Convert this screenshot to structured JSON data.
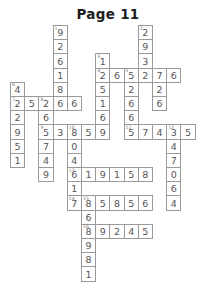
{
  "page": {
    "title": "Page 11"
  },
  "puzzle": {
    "type": "number-crossword",
    "columns": 14,
    "rows": 15,
    "cell_size": 14.2,
    "origin_x": 10,
    "origin_y": 25,
    "border_color": "#9a9a9a",
    "digit_color": "#555555",
    "clue_number_color": "#777777",
    "cells": [
      {
        "c": 3,
        "r": 0,
        "d": "9",
        "n": "1"
      },
      {
        "c": 3,
        "r": 1,
        "d": "2"
      },
      {
        "c": 3,
        "r": 2,
        "d": "6"
      },
      {
        "c": 3,
        "r": 3,
        "d": "1"
      },
      {
        "c": 3,
        "r": 4,
        "d": "8"
      },
      {
        "c": 3,
        "r": 5,
        "d": "6"
      },
      {
        "c": 9,
        "r": 0,
        "d": "2",
        "n": "2"
      },
      {
        "c": 9,
        "r": 1,
        "d": "9"
      },
      {
        "c": 9,
        "r": 2,
        "d": "3"
      },
      {
        "c": 6,
        "r": 2,
        "d": "1",
        "n": "3"
      },
      {
        "c": 6,
        "r": 3,
        "d": "2",
        "n": "4"
      },
      {
        "c": 7,
        "r": 3,
        "d": "6"
      },
      {
        "c": 8,
        "r": 3,
        "d": "5",
        "n": "5"
      },
      {
        "c": 9,
        "r": 3,
        "d": "2"
      },
      {
        "c": 10,
        "r": 3,
        "d": "7"
      },
      {
        "c": 11,
        "r": 3,
        "d": "6"
      },
      {
        "c": 6,
        "r": 4,
        "d": "5"
      },
      {
        "c": 8,
        "r": 4,
        "d": "2"
      },
      {
        "c": 10,
        "r": 4,
        "d": "2"
      },
      {
        "c": 0,
        "r": 4,
        "d": "4",
        "n": "6"
      },
      {
        "c": 0,
        "r": 5,
        "d": "2",
        "n": "7"
      },
      {
        "c": 1,
        "r": 5,
        "d": "5"
      },
      {
        "c": 2,
        "r": 5,
        "d": "2",
        "n": "8"
      },
      {
        "c": 3,
        "r": 5,
        "d": "6"
      },
      {
        "c": 4,
        "r": 5,
        "d": "6"
      },
      {
        "c": 6,
        "r": 5,
        "d": "1"
      },
      {
        "c": 8,
        "r": 5,
        "d": "6"
      },
      {
        "c": 10,
        "r": 5,
        "d": "6"
      },
      {
        "c": 0,
        "r": 6,
        "d": "2"
      },
      {
        "c": 2,
        "r": 6,
        "d": "6"
      },
      {
        "c": 6,
        "r": 6,
        "d": "6"
      },
      {
        "c": 8,
        "r": 6,
        "d": "6"
      },
      {
        "c": 0,
        "r": 7,
        "d": "9"
      },
      {
        "c": 2,
        "r": 7,
        "d": "5",
        "n": "9"
      },
      {
        "c": 3,
        "r": 7,
        "d": "3"
      },
      {
        "c": 4,
        "r": 7,
        "d": "8",
        "n": "10"
      },
      {
        "c": 5,
        "r": 7,
        "d": "5"
      },
      {
        "c": 6,
        "r": 7,
        "d": "9"
      },
      {
        "c": 8,
        "r": 7,
        "d": "5",
        "n": "11"
      },
      {
        "c": 9,
        "r": 7,
        "d": "7"
      },
      {
        "c": 10,
        "r": 7,
        "d": "4"
      },
      {
        "c": 11,
        "r": 7,
        "d": "3",
        "n": "12"
      },
      {
        "c": 12,
        "r": 7,
        "d": "5"
      },
      {
        "c": 0,
        "r": 8,
        "d": "5"
      },
      {
        "c": 2,
        "r": 8,
        "d": "7"
      },
      {
        "c": 4,
        "r": 8,
        "d": "0"
      },
      {
        "c": 11,
        "r": 8,
        "d": "4"
      },
      {
        "c": 0,
        "r": 9,
        "d": "1"
      },
      {
        "c": 2,
        "r": 9,
        "d": "4"
      },
      {
        "c": 4,
        "r": 9,
        "d": "4"
      },
      {
        "c": 11,
        "r": 9,
        "d": "7"
      },
      {
        "c": 2,
        "r": 10,
        "d": "9"
      },
      {
        "c": 4,
        "r": 10,
        "d": "6",
        "n": "13"
      },
      {
        "c": 5,
        "r": 10,
        "d": "1"
      },
      {
        "c": 6,
        "r": 10,
        "d": "9"
      },
      {
        "c": 7,
        "r": 10,
        "d": "1"
      },
      {
        "c": 8,
        "r": 10,
        "d": "5"
      },
      {
        "c": 9,
        "r": 10,
        "d": "8"
      },
      {
        "c": 11,
        "r": 10,
        "d": "0"
      },
      {
        "c": 4,
        "r": 11,
        "d": "1"
      },
      {
        "c": 11,
        "r": 11,
        "d": "6"
      },
      {
        "c": 4,
        "r": 12,
        "d": "7",
        "n": "14"
      },
      {
        "c": 5,
        "r": 12,
        "d": "8",
        "n": "15"
      },
      {
        "c": 6,
        "r": 12,
        "d": "5"
      },
      {
        "c": 7,
        "r": 12,
        "d": "8"
      },
      {
        "c": 8,
        "r": 12,
        "d": "5"
      },
      {
        "c": 9,
        "r": 12,
        "d": "6"
      },
      {
        "c": 11,
        "r": 12,
        "d": "4"
      },
      {
        "c": 5,
        "r": 13,
        "d": "6"
      },
      {
        "c": 5,
        "r": 14,
        "d": "8",
        "n": "16"
      },
      {
        "c": 6,
        "r": 14,
        "d": "9"
      },
      {
        "c": 7,
        "r": 14,
        "d": "2"
      },
      {
        "c": 8,
        "r": 14,
        "d": "4"
      },
      {
        "c": 9,
        "r": 14,
        "d": "5"
      },
      {
        "c": 5,
        "r": 15,
        "d": "9"
      },
      {
        "c": 5,
        "r": 16,
        "d": "8"
      },
      {
        "c": 5,
        "r": 17,
        "d": "1"
      }
    ]
  }
}
